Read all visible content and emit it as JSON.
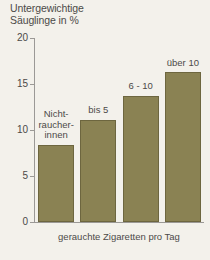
{
  "chart_data": {
    "type": "bar",
    "title": "Untergewichtige Säuglinge in %",
    "title_line1": "Untergewichtige",
    "title_line2": "Säuglinge in %",
    "xlabel": "gerauchte Zigaretten pro Tag",
    "ylabel": "Untergewichtige Säuglinge in %",
    "categories": [
      "Nichtraucherinnen",
      "bis 5",
      "6 - 10",
      "über 10"
    ],
    "category_labels_display": [
      [
        "Nicht-",
        "raucher-",
        "innen"
      ],
      [
        "bis 5"
      ],
      [
        "6 - 10"
      ],
      [
        "über 10"
      ]
    ],
    "values": [
      8.4,
      11.1,
      13.7,
      16.3
    ],
    "ylim": [
      0,
      20
    ],
    "yticks": [
      0,
      5,
      10,
      15,
      20
    ],
    "ytick_labels": [
      "0",
      "5",
      "10",
      "15",
      "20"
    ],
    "grid": false,
    "legend": false,
    "bar_color": "#8a8253",
    "bar_border_color": "#6d663f",
    "axis_color": "#9b9996",
    "text_color": "#4c4a48",
    "background_color": "#f3f1eb"
  }
}
